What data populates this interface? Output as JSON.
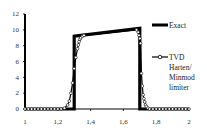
{
  "chart_data": {
    "type": "line",
    "title": "",
    "xlabel": "",
    "ylabel": "",
    "xlim": [
      1,
      2
    ],
    "ylim": [
      0,
      12
    ],
    "grid": false,
    "legend_position": "right",
    "x_ticks": [
      "1",
      "1,2",
      "1,4",
      "1,6",
      "1,8",
      "2"
    ],
    "x_tick_values": [
      1,
      1.2,
      1.4,
      1.6,
      1.8,
      2
    ],
    "y_ticks": [
      "0",
      "2",
      "4",
      "6",
      "8",
      "10",
      "12"
    ],
    "y_tick_values": [
      0,
      2,
      4,
      6,
      8,
      10,
      12
    ],
    "series": [
      {
        "name": "Exact",
        "style": "thick-line",
        "color": "#000000",
        "x": [
          1.0,
          1.3,
          1.3,
          1.7,
          1.7,
          2.0
        ],
        "y": [
          0,
          0,
          9.2,
          10.2,
          0,
          0
        ]
      },
      {
        "name": "TVD Harten/ Minmod limiter",
        "style": "line-with-open-circles",
        "color": "#000000",
        "x": [
          1.0,
          1.02,
          1.04,
          1.06,
          1.08,
          1.1,
          1.12,
          1.14,
          1.16,
          1.18,
          1.2,
          1.22,
          1.24,
          1.26,
          1.27,
          1.28,
          1.29,
          1.3,
          1.31,
          1.32,
          1.325,
          1.33,
          1.335,
          1.34,
          1.35,
          1.36,
          1.68,
          1.69,
          1.695,
          1.7,
          1.705,
          1.71,
          1.715,
          1.72,
          1.725,
          1.73,
          1.735,
          1.74,
          1.75,
          1.76,
          1.78,
          1.8,
          1.82,
          1.84,
          1.86,
          1.88,
          1.9,
          1.92,
          1.94,
          1.96,
          1.98,
          2.0
        ],
        "y": [
          0,
          0,
          0,
          0,
          0,
          0,
          0,
          0,
          0,
          0,
          0,
          0,
          0.1,
          0.5,
          1.0,
          2.0,
          3.3,
          5.1,
          6.5,
          7.6,
          8.1,
          8.5,
          8.8,
          9.0,
          9.2,
          9.3,
          10.0,
          9.7,
          9.3,
          8.9,
          8.3,
          4.5,
          2.9,
          1.8,
          1.3,
          0.9,
          0.5,
          0.3,
          0.1,
          0,
          0,
          0,
          0,
          0,
          0,
          0,
          0,
          0,
          0,
          0,
          0,
          0
        ]
      }
    ]
  },
  "legend": {
    "items": [
      {
        "label_lines": [
          "Exact"
        ]
      },
      {
        "label_lines": [
          "TVD",
          "Harten/",
          "Minmod",
          "limiter"
        ]
      }
    ]
  }
}
